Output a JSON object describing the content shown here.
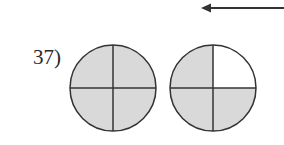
{
  "problem": {
    "number_label": "37)"
  },
  "figure": {
    "shade_color": "#d9d9d9",
    "stroke_color": "#333333",
    "circles": [
      {
        "name": "whole-1",
        "parts": 4,
        "shaded_parts": 4,
        "cx": 113,
        "cy": 88,
        "r": 43
      },
      {
        "name": "whole-2",
        "parts": 4,
        "shaded_parts": 3,
        "unshaded_quadrant": "top-right",
        "cx": 213,
        "cy": 88,
        "r": 43
      }
    ],
    "arrow": {
      "direction": "left",
      "x1": 284,
      "x2": 201,
      "y": 8
    }
  }
}
